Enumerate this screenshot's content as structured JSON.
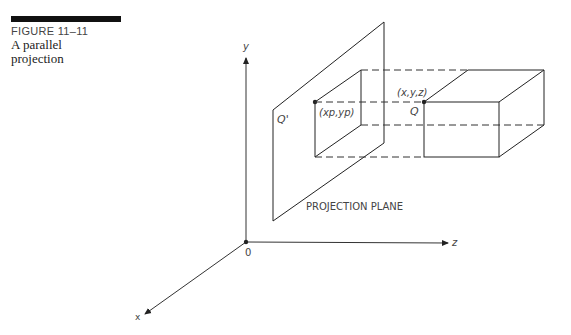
{
  "caption": {
    "figure_label": "FIGURE 11–11",
    "title_line1": "A parallel",
    "title_line2": "projection"
  },
  "axes": {
    "y_label": "y",
    "z_label": "z",
    "x_label": "x",
    "origin_label": "0"
  },
  "labels": {
    "projected_point": "Q'",
    "projected_coords": "(xp,yp)",
    "point": "Q",
    "point_coords": "(x,y,z)",
    "plane": "PROJECTION PLANE"
  },
  "colors": {
    "line": "#222222",
    "text": "#444444",
    "background": "#ffffff"
  }
}
